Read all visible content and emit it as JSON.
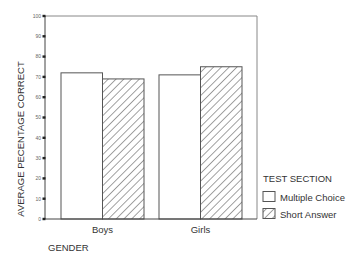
{
  "chart_data": {
    "type": "bar",
    "title": "",
    "xlabel": "GENDER",
    "ylabel": "AVERAGE PECENTAGE CORRECT",
    "categories": [
      "Boys",
      "Girls"
    ],
    "series": [
      {
        "name": "Multiple Choice",
        "values": [
          72,
          71
        ],
        "pattern": "solid",
        "fill": "#ffffff"
      },
      {
        "name": "Short Answer",
        "values": [
          69,
          75
        ],
        "pattern": "hatch",
        "fill": "#ffffff"
      }
    ],
    "ylim": [
      0,
      100
    ],
    "yticks": [
      0,
      10,
      20,
      30,
      40,
      50,
      60,
      70,
      80,
      90,
      100
    ],
    "grid": false,
    "legend": {
      "title": "TEST SECTION",
      "position": "right",
      "entries": [
        "Multiple Choice",
        "Short Answer"
      ]
    }
  },
  "colors": {
    "axis": "#444444",
    "bar_edge": "#555555",
    "hatch": "#555555",
    "frame": "#777777"
  }
}
